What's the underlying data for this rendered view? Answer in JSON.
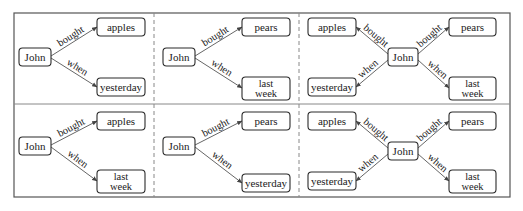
{
  "figure": {
    "frame": {
      "x": 14,
      "y": 13,
      "w": 496,
      "h": 184
    },
    "row_divider_y": 104,
    "column_dividers_x": [
      154,
      299
    ],
    "panels": [
      {
        "id": "r1c1",
        "nodes": [
          {
            "id": "john",
            "lines": [
              "John"
            ],
            "x": 19,
            "y": 48,
            "w": 32,
            "h": 18
          },
          {
            "id": "obj",
            "lines": [
              "apples"
            ],
            "x": 97,
            "y": 18,
            "w": 48,
            "h": 18
          },
          {
            "id": "time",
            "lines": [
              "yesterday"
            ],
            "x": 97,
            "y": 78,
            "w": 48,
            "h": 18
          }
        ],
        "edges": [
          {
            "label": "bought",
            "from": [
              51,
              56
            ],
            "to": [
              97,
              27
            ]
          },
          {
            "label": "when",
            "from": [
              51,
              58
            ],
            "to": [
              97,
              87
            ]
          }
        ]
      },
      {
        "id": "r1c2",
        "nodes": [
          {
            "id": "john",
            "lines": [
              "John"
            ],
            "x": 163,
            "y": 48,
            "w": 32,
            "h": 18
          },
          {
            "id": "obj",
            "lines": [
              "pears"
            ],
            "x": 242,
            "y": 18,
            "w": 48,
            "h": 18
          },
          {
            "id": "time",
            "lines": [
              "last",
              "week"
            ],
            "x": 242,
            "y": 77,
            "w": 48,
            "h": 23
          }
        ],
        "edges": [
          {
            "label": "bought",
            "from": [
              195,
              56
            ],
            "to": [
              242,
              27
            ]
          },
          {
            "label": "when",
            "from": [
              195,
              58
            ],
            "to": [
              242,
              88
            ]
          }
        ]
      },
      {
        "id": "r1c3",
        "nodes": [
          {
            "id": "obj1",
            "lines": [
              "apples"
            ],
            "x": 308,
            "y": 18,
            "w": 48,
            "h": 18
          },
          {
            "id": "time1",
            "lines": [
              "yesterday"
            ],
            "x": 308,
            "y": 78,
            "w": 48,
            "h": 18
          },
          {
            "id": "john",
            "lines": [
              "John"
            ],
            "x": 388,
            "y": 48,
            "w": 30,
            "h": 18
          },
          {
            "id": "obj2",
            "lines": [
              "pears"
            ],
            "x": 449,
            "y": 18,
            "w": 47,
            "h": 18
          },
          {
            "id": "time2",
            "lines": [
              "last",
              "week"
            ],
            "x": 449,
            "y": 77,
            "w": 47,
            "h": 23
          }
        ],
        "edges": [
          {
            "label": "bought",
            "from": [
              388,
              54
            ],
            "to": [
              356,
              27
            ]
          },
          {
            "label": "when",
            "from": [
              388,
              60
            ],
            "to": [
              356,
              87
            ]
          },
          {
            "label": "bought",
            "from": [
              418,
              54
            ],
            "to": [
              449,
              27
            ]
          },
          {
            "label": "when",
            "from": [
              418,
              60
            ],
            "to": [
              449,
              88
            ]
          }
        ]
      },
      {
        "id": "r2c1",
        "nodes": [
          {
            "id": "john",
            "lines": [
              "John"
            ],
            "x": 19,
            "y": 137,
            "w": 32,
            "h": 18
          },
          {
            "id": "obj",
            "lines": [
              "apples"
            ],
            "x": 97,
            "y": 112,
            "w": 48,
            "h": 18
          },
          {
            "id": "time",
            "lines": [
              "last",
              "week"
            ],
            "x": 97,
            "y": 170,
            "w": 48,
            "h": 23
          }
        ],
        "edges": [
          {
            "label": "bought",
            "from": [
              51,
              145
            ],
            "to": [
              97,
              121
            ]
          },
          {
            "label": "when",
            "from": [
              51,
              147
            ],
            "to": [
              97,
              181
            ]
          }
        ]
      },
      {
        "id": "r2c2",
        "nodes": [
          {
            "id": "john",
            "lines": [
              "John"
            ],
            "x": 163,
            "y": 137,
            "w": 32,
            "h": 18
          },
          {
            "id": "obj",
            "lines": [
              "pears"
            ],
            "x": 242,
            "y": 112,
            "w": 48,
            "h": 18
          },
          {
            "id": "time",
            "lines": [
              "yesterday"
            ],
            "x": 242,
            "y": 174,
            "w": 48,
            "h": 18
          }
        ],
        "edges": [
          {
            "label": "bought",
            "from": [
              195,
              145
            ],
            "to": [
              242,
              121
            ]
          },
          {
            "label": "when",
            "from": [
              195,
              147
            ],
            "to": [
              242,
              183
            ]
          }
        ]
      },
      {
        "id": "r2c3",
        "nodes": [
          {
            "id": "obj1",
            "lines": [
              "apples"
            ],
            "x": 308,
            "y": 112,
            "w": 48,
            "h": 18
          },
          {
            "id": "time1",
            "lines": [
              "yesterday"
            ],
            "x": 308,
            "y": 172,
            "w": 48,
            "h": 18
          },
          {
            "id": "john",
            "lines": [
              "John"
            ],
            "x": 388,
            "y": 142,
            "w": 30,
            "h": 18
          },
          {
            "id": "obj2",
            "lines": [
              "pears"
            ],
            "x": 449,
            "y": 112,
            "w": 47,
            "h": 18
          },
          {
            "id": "time2",
            "lines": [
              "last",
              "week"
            ],
            "x": 449,
            "y": 170,
            "w": 47,
            "h": 23
          }
        ],
        "edges": [
          {
            "label": "bought",
            "from": [
              388,
              148
            ],
            "to": [
              356,
              121
            ]
          },
          {
            "label": "when",
            "from": [
              388,
              154
            ],
            "to": [
              356,
              181
            ]
          },
          {
            "label": "bought",
            "from": [
              418,
              148
            ],
            "to": [
              449,
              121
            ]
          },
          {
            "label": "when",
            "from": [
              418,
              154
            ],
            "to": [
              449,
              181
            ]
          }
        ]
      }
    ]
  }
}
